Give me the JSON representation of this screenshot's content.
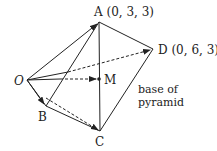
{
  "diagram": {
    "points": {
      "O": {
        "label": "O"
      },
      "A": {
        "label": "A (0, 3, 3)"
      },
      "D": {
        "label": "D (0, 6, 3)"
      },
      "M": {
        "label": "M"
      },
      "B": {
        "label": "B"
      },
      "C": {
        "label": "C"
      }
    },
    "annotation": {
      "line1": "base of",
      "line2": "pyramid"
    }
  }
}
